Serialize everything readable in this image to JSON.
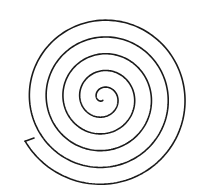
{
  "figure": {
    "type": "archimedean-spiral",
    "background": "#ffffff",
    "stroke_color": "#1a1a1a",
    "stroke_width": 1.6,
    "center": [
      103,
      98
    ],
    "turns": 5.3,
    "spacing_px": 16.8,
    "end_hook": [
      [
        20,
        144
      ],
      [
        34,
        138
      ]
    ]
  }
}
